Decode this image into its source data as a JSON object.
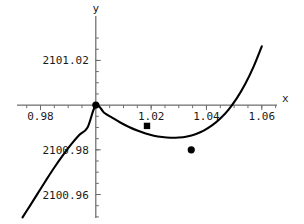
{
  "chart_data": {
    "type": "line",
    "title": "",
    "xlabel": "x",
    "ylabel": "y",
    "xlim": [
      0.9715,
      1.0655
    ],
    "ylim": [
      2100.9495,
      2101.0345
    ],
    "grid": false,
    "legend": null,
    "x_ticks": [
      {
        "value": 0.98,
        "label": "0.98"
      },
      {
        "value": 1.02,
        "label": "1.02"
      },
      {
        "value": 1.04,
        "label": "1.04"
      },
      {
        "value": 1.06,
        "label": "1.06"
      }
    ],
    "y_ticks": [
      {
        "value": 2101.02,
        "label": "2101.02"
      },
      {
        "value": 2100.98,
        "label": "2100.98"
      },
      {
        "value": 2100.96,
        "label": "2100.96"
      }
    ],
    "x_minor_tick_step": 0.005,
    "y_minor_tick_step": 0.005,
    "axis_origin": {
      "x": 1.0,
      "y": 2101.0
    },
    "series": [
      {
        "name": "cubic curve",
        "x": [
          0.9735,
          0.976,
          0.979,
          0.982,
          0.985,
          0.988,
          0.991,
          0.994,
          0.997,
          1.0,
          1.003,
          1.006,
          1.009,
          1.012,
          1.015,
          1.018,
          1.021,
          1.024,
          1.027,
          1.03,
          1.033,
          1.036,
          1.039,
          1.042,
          1.045,
          1.048,
          1.051,
          1.054,
          1.057,
          1.06
        ],
        "y": [
          2100.9498,
          2100.9546,
          2100.9605,
          2100.9664,
          2100.9721,
          2100.9774,
          2100.9823,
          2100.9866,
          2100.99,
          2101.0,
          2100.9966,
          2100.9943,
          2100.9921,
          2100.9902,
          2100.9886,
          2100.9873,
          2100.9863,
          2100.9857,
          2100.9854,
          2100.9855,
          2100.986,
          2100.987,
          2100.9886,
          2100.9909,
          2100.994,
          2100.998,
          2101.0031,
          2101.0094,
          2101.0171,
          2101.0263
        ]
      }
    ],
    "points": [
      {
        "x": 1.0,
        "y": 2101.0,
        "marker": "filled-circle"
      },
      {
        "x": 1.0185,
        "y": 2100.9907,
        "marker": "filled-square"
      },
      {
        "x": 1.0345,
        "y": 2100.98,
        "marker": "filled-circle"
      }
    ],
    "colors": {
      "curve": "#000000",
      "axis": "#4a4a4a",
      "text": "#1a1a1a",
      "marker": "#000000",
      "background": "#ffffff"
    }
  },
  "labels": {
    "x_axis_name": "x",
    "y_axis_name": "y",
    "x_tick_1": "0.98",
    "x_tick_2": "1.02",
    "x_tick_3": "1.04",
    "x_tick_4": "1.06",
    "y_tick_1": "2101.02",
    "y_tick_2": "2100.98",
    "y_tick_3": "2100.96"
  }
}
